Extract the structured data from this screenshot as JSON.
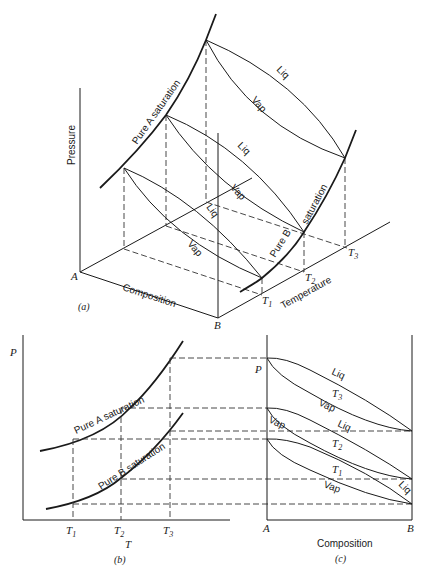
{
  "figure": {
    "panel_a": {
      "caption": "(a)",
      "axes": {
        "pressure": "Pressure",
        "composition": "Composition",
        "temperature": "Temperature"
      },
      "corners": {
        "a": "A",
        "b": "B"
      },
      "temperature_ticks": [
        {
          "main": "T",
          "sub": "1"
        },
        {
          "main": "T",
          "sub": "2"
        },
        {
          "main": "T",
          "sub": "3"
        }
      ],
      "curves": {
        "pure_a": "Pure A saturation",
        "pure_b_1": "Pure B",
        "pure_b_2": "saturation"
      },
      "lens_labels": {
        "liq": "Liq",
        "vap": "Vap"
      }
    },
    "panel_b": {
      "caption": "(b)",
      "y_label": "P",
      "x_label": "T",
      "curves": {
        "pure_a": "Pure A saturation",
        "pure_b": "Pure B saturation"
      },
      "ticks": [
        {
          "main": "T",
          "sub": "1"
        },
        {
          "main": "T",
          "sub": "2"
        },
        {
          "main": "T",
          "sub": "3"
        }
      ]
    },
    "panel_c": {
      "caption": "(c)",
      "y_label": "P",
      "x_label": "Composition",
      "left": "A",
      "right": "B",
      "lens": [
        {
          "t_main": "T",
          "t_sub": "3",
          "liq": "Liq",
          "vap": "Vap"
        },
        {
          "t_main": "T",
          "t_sub": "2",
          "liq": "Liq",
          "vap": "Vap"
        },
        {
          "t_main": "T",
          "t_sub": "1",
          "liq": "Liq",
          "vap": "Vap"
        }
      ]
    }
  }
}
